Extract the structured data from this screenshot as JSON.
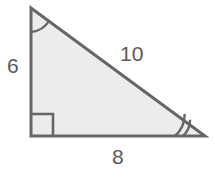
{
  "figure": {
    "name": "right-triangle",
    "fill_color": "#ececec",
    "stroke_color": "#666666",
    "text_color": "#5a5a5a",
    "background_color": "#ffffff"
  },
  "labels": {
    "vertical_leg": "6",
    "horizontal_leg": "8",
    "hypotenuse": "10"
  },
  "markers": {
    "right_angle": "right-angle-square",
    "top_angle_arcs": 1,
    "bottom_right_angle_arcs": 2
  },
  "geometry": {
    "vertices": {
      "top": [
        31,
        8
      ],
      "bottom_left": [
        31,
        136
      ],
      "bottom_right": [
        205,
        136
      ]
    },
    "right_angle_square_size": 22,
    "top_arc_radius": 24,
    "bottom_arc_radius_inner": 22,
    "bottom_arc_radius_outer": 30
  }
}
